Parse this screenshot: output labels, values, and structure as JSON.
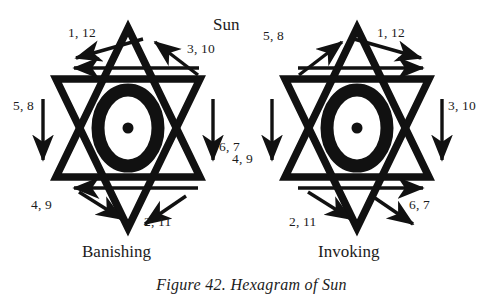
{
  "figure": {
    "caption": "Figure 42. Hexagram of Sun",
    "planet_label": "Sun",
    "left_name": "Banishing",
    "right_name": "Invoking",
    "stroke_color": "#111111",
    "background_color": "#ffffff",
    "center_symbol": "sun-eye-glyph"
  },
  "banishing": {
    "title": "Banishing",
    "labels": {
      "top_left": "1, 12",
      "top_right": "3, 10",
      "left": "5, 8",
      "right": "6, 7",
      "bottom_left": "4, 9",
      "bottom_right": "2, 11"
    }
  },
  "invoking": {
    "title": "Invoking",
    "labels": {
      "top_left": "5, 8",
      "top_right": "1, 12",
      "left": "4, 9",
      "right": "3, 10",
      "bottom_left": "2, 11",
      "bottom_right": "6, 7"
    }
  }
}
